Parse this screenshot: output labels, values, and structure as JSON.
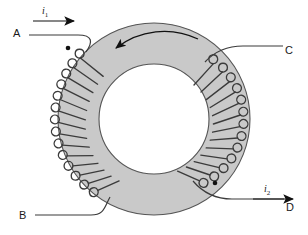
{
  "figure": {
    "type": "toroidal-transformer-schematic",
    "colors": {
      "core_fill": "#c9c9c9",
      "core_outline": "#4d4d4d",
      "wire": "#3b3b3b",
      "lead": "#3b3b3b",
      "text": "#1a1a1a",
      "background": "#ffffff",
      "dot": "#111111",
      "flux_arrow": "#111111"
    },
    "terminals": [
      {
        "id": "A",
        "label": "A",
        "position": "top-left",
        "winding": "primary"
      },
      {
        "id": "B",
        "label": "B",
        "position": "bottom-left",
        "winding": "primary"
      },
      {
        "id": "C",
        "label": "C",
        "position": "top-right",
        "winding": "secondary"
      },
      {
        "id": "D",
        "label": "D",
        "position": "bottom-right",
        "winding": "secondary"
      }
    ],
    "currents": [
      {
        "id": "i1",
        "symbol": "i",
        "subscript": "1",
        "direction": "right",
        "near_terminal": "A"
      },
      {
        "id": "i2",
        "symbol": "i",
        "subscript": "2",
        "direction": "right",
        "near_terminal": "D"
      }
    ],
    "polarity_dots": [
      {
        "near_terminal": "A",
        "x": 68,
        "y": 48
      },
      {
        "near_terminal": "D",
        "x": 215,
        "y": 183
      }
    ],
    "flux_arrow": {
      "sense": "counterclockwise",
      "location": "inside core, upper arc",
      "head_direction": "left"
    },
    "core": {
      "shape": "annulus",
      "center_x": 154,
      "center_y": 119,
      "outer_radius": 96,
      "inner_radius": 55
    },
    "windings": {
      "primary_turns": 14,
      "secondary_turns": 13,
      "primary_arc_degrees": [
        120,
        250
      ],
      "secondary_arc_degrees": [
        300,
        65
      ]
    }
  }
}
